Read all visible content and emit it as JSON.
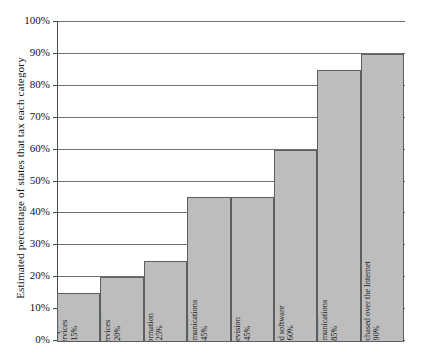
{
  "chart_data": {
    "type": "bar",
    "title": "",
    "xlabel": "",
    "ylabel": "Estimated percentage of states that tax each category",
    "ylim": [
      0,
      100
    ],
    "grid": true,
    "legend": "none",
    "orientation": "vertical",
    "y_tick_labels": [
      "100%",
      "90%",
      "80%",
      "70%",
      "60%",
      "50%",
      "40%",
      "30%",
      "20%",
      "10%",
      "0%"
    ],
    "y_tick_values": [
      100,
      90,
      80,
      70,
      60,
      50,
      40,
      30,
      20,
      10,
      0
    ],
    "categories": [
      "Computer services",
      "Internet access services",
      "Electronically transmitted information",
      "Interstate telecommunications",
      "Cable television",
      "Electronically transmitted canned software",
      "Intrastate telecommunications",
      "Tangible goods purchased over the Internet"
    ],
    "values": [
      15,
      20,
      25,
      45,
      45,
      60,
      85,
      90
    ],
    "value_labels": [
      "15%",
      "20%",
      "25%",
      "45%",
      "45%",
      "60%",
      "85%",
      "90%"
    ],
    "bar_color": "#bdbdbd",
    "bar_border_color": "#5e5e5e",
    "grid_color": "#6f6f6f",
    "axis_color": "#4a4a4a"
  },
  "bars": [
    {
      "name": "computer-services",
      "lines": [
        "Computer",
        "services",
        "15%"
      ],
      "value": 15
    },
    {
      "name": "internet-access-services",
      "lines": [
        "Internet access",
        "services",
        "20%"
      ],
      "value": 20
    },
    {
      "name": "electronically-transmitted-information",
      "lines": [
        "Electronically",
        "transmitted",
        "information",
        "25%"
      ],
      "value": 25
    },
    {
      "name": "interstate-telecommunications",
      "lines": [
        "Interstate",
        "telecommunications",
        "45%"
      ],
      "value": 45
    },
    {
      "name": "cable-television",
      "lines": [
        "Cable",
        "television",
        "45%"
      ],
      "value": 45
    },
    {
      "name": "electronically-transmitted-canned-software",
      "lines": [
        "Electronically",
        "transmitted",
        "canned software",
        "60%"
      ],
      "value": 60
    },
    {
      "name": "intrastate-telecommunications",
      "lines": [
        "Intrastate",
        "telecommunications",
        "85%"
      ],
      "value": 85
    },
    {
      "name": "tangible-goods-purchased-over-the-internet",
      "lines": [
        "Tangible goods purchased over the Internet",
        "90%"
      ],
      "value": 90
    }
  ]
}
